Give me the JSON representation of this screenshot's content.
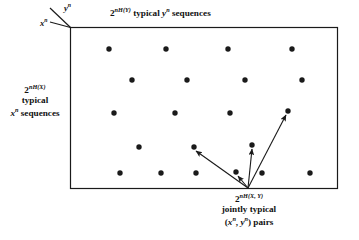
{
  "figure": {
    "name": "joint-typicality-diagram",
    "background_color": "#ffffff",
    "ink_color": "#1a1a1a"
  },
  "axes": {
    "y_axis_label": "y",
    "y_axis_exponent": "n",
    "x_axis_label": "x",
    "x_axis_exponent": "n"
  },
  "labels": {
    "top": {
      "base": "2",
      "exponent": "nH(Y)",
      "text": " typical ",
      "symbol": "y",
      "symbol_exponent": "n",
      "tail": " sequences",
      "full": "2^{nH(Y)} typical y^n sequences"
    },
    "left": {
      "base": "2",
      "exponent": "nH(X)",
      "line2": "typical",
      "symbol": "x",
      "symbol_exponent": "n",
      "tail": " sequences",
      "full": "2^{nH(X)} typical x^n sequences"
    },
    "bottom": {
      "base": "2",
      "exponent": "nH(X, Y)",
      "line2": "jointly typical",
      "open": "(",
      "sym1": "x",
      "sym1_exponent": "n",
      "comma": ", ",
      "sym2": "y",
      "sym2_exponent": "n",
      "close": ") pairs",
      "full": "2^{nH(X,Y)} jointly typical (x^n, y^n) pairs"
    }
  },
  "chart_data": {
    "type": "scatter",
    "xlabel": "2^{nH(Y)} typical y^n sequences",
    "ylabel": "2^{nH(X)} typical x^n sequences",
    "grid": false,
    "legend": "none",
    "xlim": [
      70,
      338
    ],
    "ylim": [
      27,
      189
    ],
    "rect": {
      "x": 70,
      "y": 27,
      "width": 268,
      "height": 162
    },
    "point_radius": 2.7,
    "points": [
      {
        "x": 109,
        "y": 49
      },
      {
        "x": 166,
        "y": 49
      },
      {
        "x": 228,
        "y": 49
      },
      {
        "x": 292,
        "y": 49
      },
      {
        "x": 132,
        "y": 80
      },
      {
        "x": 187,
        "y": 80
      },
      {
        "x": 245,
        "y": 80
      },
      {
        "x": 302,
        "y": 80
      },
      {
        "x": 114,
        "y": 113
      },
      {
        "x": 175,
        "y": 113
      },
      {
        "x": 230,
        "y": 113
      },
      {
        "x": 288,
        "y": 111
      },
      {
        "x": 139,
        "y": 147
      },
      {
        "x": 194,
        "y": 147
      },
      {
        "x": 252,
        "y": 145
      },
      {
        "x": 120,
        "y": 173
      },
      {
        "x": 161,
        "y": 173
      },
      {
        "x": 196,
        "y": 173
      },
      {
        "x": 236,
        "y": 172
      },
      {
        "x": 262,
        "y": 173
      },
      {
        "x": 310,
        "y": 173
      }
    ],
    "arrow_origin": {
      "x": 248,
      "y": 188
    },
    "arrows": [
      {
        "to_x": 196,
        "to_y": 151,
        "target_point": "row4-left"
      },
      {
        "to_x": 238,
        "to_y": 176,
        "target_point": "row5-mid"
      },
      {
        "to_x": 252,
        "to_y": 149,
        "target_point": "row4-right"
      },
      {
        "to_x": 286,
        "to_y": 115,
        "target_point": "row3-right"
      }
    ]
  }
}
